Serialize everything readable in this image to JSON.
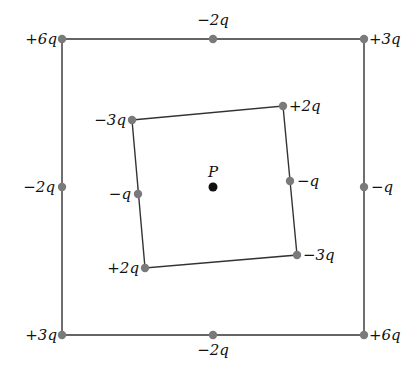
{
  "diagram": {
    "point": {
      "label": "P",
      "x": 213,
      "y": 187
    },
    "outer": {
      "corners": [
        {
          "x": 62,
          "y": 39
        },
        {
          "x": 364,
          "y": 39
        },
        {
          "x": 364,
          "y": 335
        },
        {
          "x": 62,
          "y": 335
        }
      ],
      "charges": [
        {
          "id": "outer-top-left",
          "x": 62,
          "y": 39,
          "label": "+6q",
          "lx": 57,
          "ly": 44,
          "anchor": "end"
        },
        {
          "id": "outer-top-mid",
          "x": 213,
          "y": 39,
          "label": "−2q",
          "lx": 213,
          "ly": 25,
          "anchor": "middle"
        },
        {
          "id": "outer-top-right",
          "x": 364,
          "y": 39,
          "label": "+3q",
          "lx": 369,
          "ly": 44,
          "anchor": "start"
        },
        {
          "id": "outer-left-mid",
          "x": 62,
          "y": 187,
          "label": "−2q",
          "lx": 55,
          "ly": 192,
          "anchor": "end"
        },
        {
          "id": "outer-right-mid",
          "x": 364,
          "y": 187,
          "label": "−q",
          "lx": 371,
          "ly": 192,
          "anchor": "start"
        },
        {
          "id": "outer-bottom-left",
          "x": 62,
          "y": 335,
          "label": "+3q",
          "lx": 57,
          "ly": 340,
          "anchor": "end"
        },
        {
          "id": "outer-bottom-mid",
          "x": 213,
          "y": 335,
          "label": "−2q",
          "lx": 213,
          "ly": 355,
          "anchor": "middle"
        },
        {
          "id": "outer-bottom-right",
          "x": 364,
          "y": 335,
          "label": "+6q",
          "lx": 369,
          "ly": 340,
          "anchor": "start"
        }
      ]
    },
    "inner": {
      "corners": [
        {
          "x": 132,
          "y": 120
        },
        {
          "x": 283,
          "y": 106
        },
        {
          "x": 297,
          "y": 255
        },
        {
          "x": 145,
          "y": 268
        }
      ],
      "charges": [
        {
          "id": "inner-top-left",
          "x": 132,
          "y": 120,
          "label": "−3q",
          "lx": 126,
          "ly": 125,
          "anchor": "end"
        },
        {
          "id": "inner-top-right",
          "x": 283,
          "y": 106,
          "label": "+2q",
          "lx": 289,
          "ly": 111,
          "anchor": "start"
        },
        {
          "id": "inner-right-mid",
          "x": 290,
          "y": 181,
          "label": "−q",
          "lx": 297,
          "ly": 186,
          "anchor": "start"
        },
        {
          "id": "inner-bottom-right",
          "x": 297,
          "y": 255,
          "label": "−3q",
          "lx": 303,
          "ly": 260,
          "anchor": "start"
        },
        {
          "id": "inner-bottom-left",
          "x": 145,
          "y": 268,
          "label": "+2q",
          "lx": 139,
          "ly": 273,
          "anchor": "end"
        },
        {
          "id": "inner-left-mid",
          "x": 138,
          "y": 194,
          "label": "−q",
          "lx": 131,
          "ly": 199,
          "anchor": "end"
        }
      ]
    },
    "colors": {
      "line": "#333333",
      "charge_dot": "#7a7a7a",
      "point_dot": "#111111"
    }
  }
}
